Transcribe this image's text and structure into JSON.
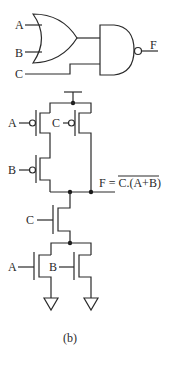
{
  "figure": {
    "caption": "(b)",
    "logic_gates": {
      "inputs": [
        "A",
        "B",
        "C"
      ],
      "or_gate": {
        "inputs": [
          "A",
          "B"
        ]
      },
      "nand_gate": {
        "inputs": [
          "A+B",
          "C"
        ],
        "output": "F"
      },
      "output_label": "F"
    },
    "cmos": {
      "pmos_labels": [
        "A",
        "C",
        "B"
      ],
      "nmos_labels": [
        "C",
        "A",
        "B"
      ],
      "output_expression": {
        "prefix": "F = ",
        "overlined": "C.(A+B)"
      }
    }
  }
}
